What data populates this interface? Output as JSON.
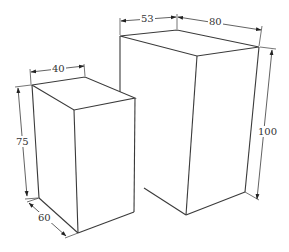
{
  "diagram": {
    "type": "isometric-boxes-dimensions",
    "colors": {
      "line": "#3a3a3a",
      "text": "#333333",
      "background": "#ffffff"
    },
    "small_box": {
      "labels": {
        "width": "40",
        "height": "75",
        "depth": "60"
      }
    },
    "large_box": {
      "labels": {
        "left_width": "53",
        "right_width": "80",
        "height": "100"
      }
    }
  }
}
